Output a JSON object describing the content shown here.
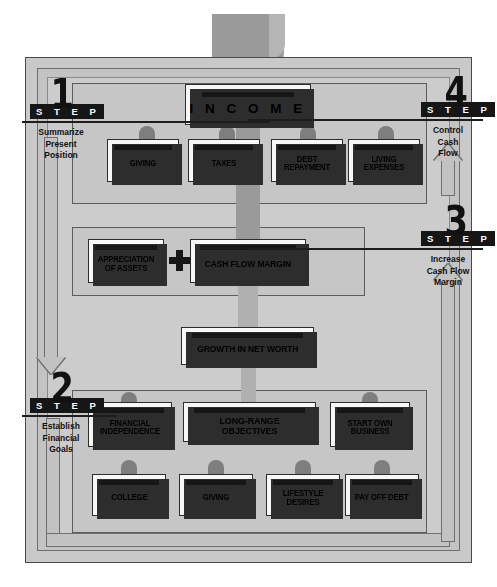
{
  "diagram": {
    "income": {
      "label": "I N C O M E"
    },
    "outflows": [
      {
        "label": "GIVING"
      },
      {
        "label": "TAXES"
      },
      {
        "label": "DEBT REPAYMENT"
      },
      {
        "label": "LIVING EXPENSES"
      }
    ],
    "middle": {
      "appreciation": {
        "label": "APPRECIATION OF ASSETS"
      },
      "operator": "+",
      "cash_flow_margin": {
        "label": "CASH FLOW MARGIN"
      },
      "growth": {
        "label": "GROWTH IN NET WORTH"
      }
    },
    "objectives": [
      {
        "label": "FINANCIAL INDEPENDENCE"
      },
      {
        "label": "LONG-RANGE OBJECTIVES"
      },
      {
        "label": "START OWN BUSINESS"
      }
    ],
    "goals": [
      {
        "label": "COLLEGE"
      },
      {
        "label": "GIVING"
      },
      {
        "label": "LIFESTYLE DESIRES"
      },
      {
        "label": "PAY OFF DEBT"
      }
    ],
    "steps": [
      {
        "number": "1",
        "word": "S T E P",
        "caption": "Summarize\nPresent\nPosition"
      },
      {
        "number": "2",
        "word": "S T E P",
        "caption": "Establish\nFinancial\nGoals"
      },
      {
        "number": "3",
        "word": "S T E P",
        "caption": "Increase\nCash Flow\nMargin"
      },
      {
        "number": "4",
        "word": "S T E P",
        "caption": "Control\nCash\nFlow"
      }
    ],
    "colors": {
      "paper_background": "#ffffff",
      "panel_grey": "#c6c6c6",
      "ribbon_grey": "#9a9a9a",
      "card_face": "#f7f7f7",
      "ink_black": "#161616"
    }
  }
}
